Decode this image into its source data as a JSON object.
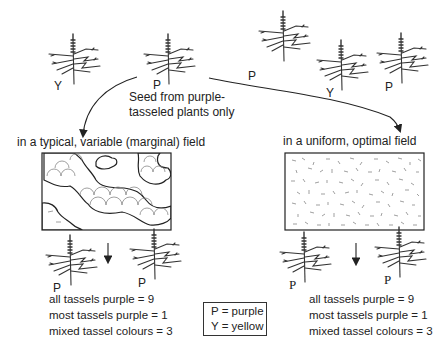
{
  "top": {
    "seed_caption_line1": "Seed from purple-",
    "seed_caption_line2": "tasseled plants only",
    "plants": [
      {
        "label": "Y",
        "color_meaning": "yellow"
      },
      {
        "label": "P",
        "color_meaning": "purple"
      },
      {
        "label": "P",
        "color_meaning": "purple"
      },
      {
        "label": "Y",
        "color_meaning": "yellow"
      },
      {
        "label": "P",
        "color_meaning": "purple"
      }
    ]
  },
  "left_branch": {
    "title": "in a typical, variable (marginal) field",
    "field_type": "patchy",
    "offspring": [
      {
        "label": "P"
      },
      {
        "label": "P"
      }
    ],
    "results": [
      {
        "text": "all tassels purple = 9"
      },
      {
        "text": "most tassels purple = 1"
      },
      {
        "text": "mixed tassel colours = 3"
      }
    ]
  },
  "right_branch": {
    "title": "in a uniform, optimal field",
    "field_type": "uniform",
    "offspring": [
      {
        "label": "P"
      },
      {
        "label": "P"
      }
    ],
    "results": [
      {
        "text": "all tassels purple = 9"
      },
      {
        "text": "most tassels purple = 1"
      },
      {
        "text": "mixed tassel colours = 3"
      }
    ]
  },
  "legend": {
    "items": [
      {
        "text": "P =  purple"
      },
      {
        "text": "Y =  yellow"
      }
    ]
  },
  "colors": {
    "ink": "#222222",
    "background": "#ffffff",
    "patch_line": "#888888"
  }
}
